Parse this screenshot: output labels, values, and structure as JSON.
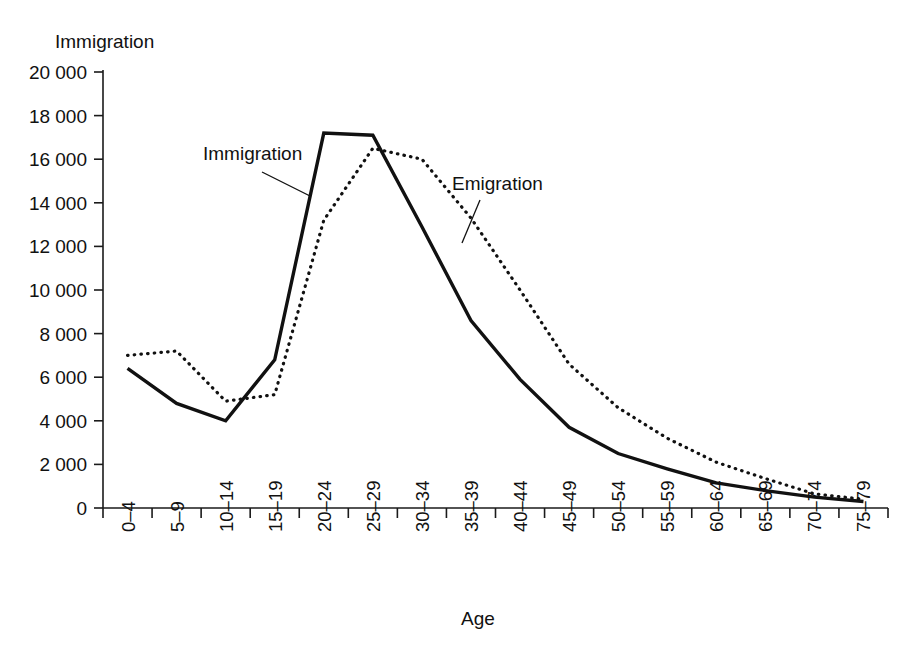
{
  "chart_data": {
    "type": "line",
    "title": "",
    "ylabel": "Immigration",
    "xlabel": "Age",
    "ylim": [
      0,
      20000
    ],
    "ytick_step": 2000,
    "grid": false,
    "legend_position": "inline-annotations",
    "categories": [
      "0–4",
      "5–9",
      "10–14",
      "15–19",
      "20–24",
      "25–29",
      "30–34",
      "35–39",
      "40–44",
      "45–49",
      "50–54",
      "55–59",
      "60–64",
      "65–69",
      "70–74",
      "75–79"
    ],
    "ytick_labels": [
      "0",
      "2 000",
      "4 000",
      "6 000",
      "8 000",
      "10 000",
      "12 000",
      "14 000",
      "16 000",
      "18 000",
      "20 000"
    ],
    "ytick_values": [
      0,
      2000,
      4000,
      6000,
      8000,
      10000,
      12000,
      14000,
      16000,
      18000,
      20000
    ],
    "series": [
      {
        "name": "Immigration",
        "style": "solid",
        "color": "#111111",
        "values": [
          6400,
          4800,
          4000,
          6800,
          17200,
          17100,
          12900,
          8600,
          5900,
          3700,
          2500,
          1800,
          1150,
          800,
          500,
          300
        ]
      },
      {
        "name": "Emigration",
        "style": "dotted",
        "color": "#111111",
        "values": [
          7000,
          7200,
          4900,
          5200,
          13200,
          16500,
          16000,
          13300,
          10000,
          6600,
          4600,
          3200,
          2100,
          1350,
          650,
          400
        ]
      }
    ],
    "annotations": [
      {
        "text": "Immigration",
        "series": "Immigration"
      },
      {
        "text": "Emigration",
        "series": "Emigration"
      }
    ]
  }
}
